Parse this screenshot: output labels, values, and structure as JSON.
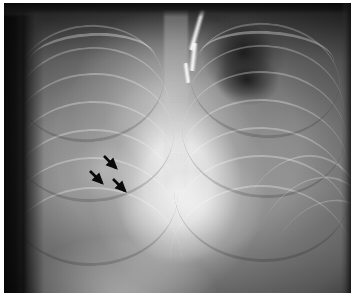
{
  "figure": {
    "kind": "chest-radiograph",
    "modality": "X-ray",
    "view": "PA chest",
    "caption": ""
  },
  "plate": {
    "background_color": "#8a8a8a",
    "border_dark_color": "#0d0d0d",
    "page_margin_color": "#ffffff"
  },
  "anatomy": {
    "regions": [
      {
        "name": "right-lung-field",
        "label": "Right lung field",
        "position": "image-left",
        "density": "increased-hazy"
      },
      {
        "name": "left-lung-field",
        "label": "Left lung field",
        "position": "image-right",
        "density": "lucent-apical"
      },
      {
        "name": "mediastinum",
        "label": "Mediastinum / cardiac silhouette",
        "position": "center",
        "density": "bright-opaque"
      },
      {
        "name": "diaphragm",
        "label": "Diaphragm",
        "position": "lower",
        "density": "bright"
      },
      {
        "name": "left-apex-lucency",
        "label": "Left apical lucency",
        "position": "upper-right",
        "density": "dark"
      }
    ]
  },
  "devices": [
    {
      "name": "catheter-tube",
      "label": "Radiopaque tube / catheter",
      "position": "upper-center",
      "color": "#f2f2f2"
    }
  ],
  "annotations": {
    "color": "#0a0a0a",
    "count": 3,
    "direction": "down-right",
    "label": "Arrows marking region of interest",
    "arrows": [
      {
        "name": "annotation-arrow-1",
        "x": 100,
        "y": 157,
        "angle": 45,
        "length": 17
      },
      {
        "name": "annotation-arrow-2",
        "x": 86,
        "y": 172,
        "angle": 45,
        "length": 17
      },
      {
        "name": "annotation-arrow-3",
        "x": 109,
        "y": 180,
        "angle": 45,
        "length": 17
      }
    ]
  },
  "ribs": {
    "label": "Rib shadows",
    "right_side_count": 7,
    "left_side_count": 7
  }
}
